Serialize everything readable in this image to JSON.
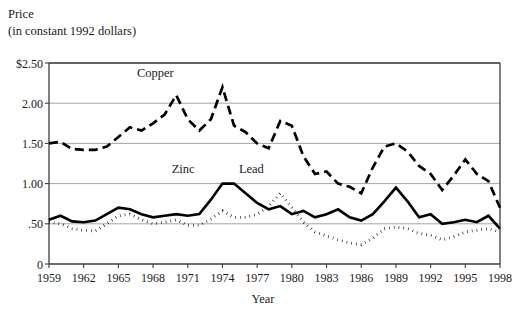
{
  "chart_data": {
    "type": "line",
    "title": "Price",
    "subtitle": "(in constant 1992 dollars)",
    "ylabel": "Price (in constant 1992 dollars)",
    "xlabel": "Year",
    "ylim": [
      0,
      2.5
    ],
    "xlim": [
      1959,
      1998
    ],
    "grid": true,
    "legend_position": "inline-annotations",
    "ytick_labels": [
      "$2.50",
      "2.00",
      "1.50",
      "1.00",
      ".50",
      "0"
    ],
    "ytick_values": [
      2.5,
      2.0,
      1.5,
      1.0,
      0.5,
      0
    ],
    "xtick_labels": [
      "1959",
      "1962",
      "1965",
      "1968",
      "1971",
      "1974",
      "1977",
      "1980",
      "1983",
      "1986",
      "1989",
      "1992",
      "1995",
      "1998"
    ],
    "xtick_values": [
      1959,
      1962,
      1965,
      1968,
      1971,
      1974,
      1977,
      1980,
      1983,
      1986,
      1989,
      1992,
      1995,
      1998
    ],
    "x": [
      1959,
      1960,
      1961,
      1962,
      1963,
      1964,
      1965,
      1966,
      1967,
      1968,
      1969,
      1970,
      1971,
      1972,
      1973,
      1974,
      1975,
      1976,
      1977,
      1978,
      1979,
      1980,
      1981,
      1982,
      1983,
      1984,
      1985,
      1986,
      1987,
      1988,
      1989,
      1990,
      1991,
      1992,
      1993,
      1994,
      1995,
      1996,
      1997,
      1998
    ],
    "series": [
      {
        "name": "Copper",
        "style": "dashed",
        "label_x": 1968.2,
        "label_y": 2.32,
        "values": [
          1.5,
          1.52,
          1.43,
          1.42,
          1.42,
          1.46,
          1.58,
          1.7,
          1.66,
          1.75,
          1.86,
          2.1,
          1.8,
          1.66,
          1.8,
          2.2,
          1.72,
          1.64,
          1.5,
          1.44,
          1.78,
          1.72,
          1.34,
          1.12,
          1.15,
          1.0,
          0.96,
          0.88,
          1.2,
          1.46,
          1.5,
          1.4,
          1.22,
          1.12,
          0.92,
          1.1,
          1.3,
          1.12,
          1.03,
          0.7
        ]
      },
      {
        "name": "Zinc",
        "style": "solid",
        "label_x": 1970.6,
        "label_y": 1.13,
        "values": [
          0.55,
          0.6,
          0.53,
          0.52,
          0.54,
          0.62,
          0.7,
          0.68,
          0.62,
          0.58,
          0.6,
          0.62,
          0.6,
          0.62,
          0.8,
          1.0,
          1.0,
          0.88,
          0.76,
          0.68,
          0.72,
          0.62,
          0.66,
          0.58,
          0.62,
          0.68,
          0.58,
          0.54,
          0.62,
          0.78,
          0.95,
          0.78,
          0.58,
          0.62,
          0.5,
          0.52,
          0.55,
          0.52,
          0.6,
          0.44
        ]
      },
      {
        "name": "Lead",
        "style": "dotted",
        "label_x": 1976.5,
        "label_y": 1.13,
        "values": [
          0.52,
          0.5,
          0.44,
          0.42,
          0.41,
          0.5,
          0.6,
          0.62,
          0.55,
          0.5,
          0.52,
          0.55,
          0.48,
          0.48,
          0.56,
          0.66,
          0.58,
          0.58,
          0.62,
          0.72,
          0.88,
          0.7,
          0.52,
          0.4,
          0.35,
          0.3,
          0.26,
          0.24,
          0.32,
          0.44,
          0.46,
          0.44,
          0.38,
          0.36,
          0.3,
          0.34,
          0.4,
          0.42,
          0.44,
          0.4
        ]
      }
    ]
  }
}
